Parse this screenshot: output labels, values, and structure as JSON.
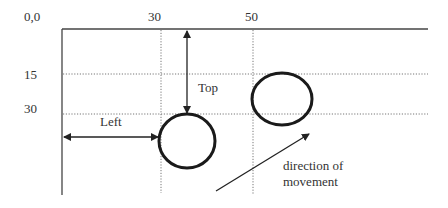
{
  "diagram": {
    "origin_label": "0,0",
    "x_ticks": [
      "30",
      "50"
    ],
    "y_ticks": [
      "15",
      "30"
    ],
    "top_label": "Top",
    "left_label": "Left",
    "direction_label_line1": "direction of",
    "direction_label_line2": "movement",
    "colors": {
      "line": "#444444",
      "circle": "#1a1a1a",
      "text": "#333333"
    }
  }
}
